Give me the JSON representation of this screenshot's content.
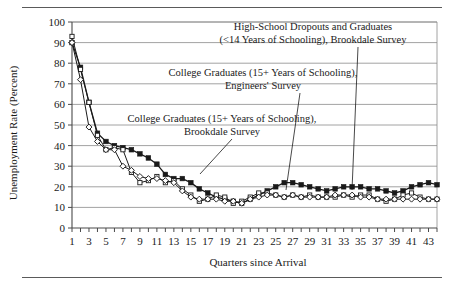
{
  "figure": {
    "name": "unemployment-rate-by-education-chart",
    "top_rule": true,
    "bottom_rule": true
  },
  "chart_data": {
    "type": "line",
    "title": "",
    "xlabel": "Quarters since Arrival",
    "ylabel": "Unemployment Rate (Percent)",
    "xlim": [
      1,
      44
    ],
    "ylim": [
      0,
      100
    ],
    "ytick_step": 10,
    "yticks": [
      0,
      10,
      20,
      30,
      40,
      50,
      60,
      70,
      80,
      90,
      100
    ],
    "xticks": [
      1,
      2,
      3,
      4,
      5,
      6,
      7,
      8,
      9,
      10,
      11,
      12,
      13,
      14,
      15,
      16,
      17,
      18,
      19,
      20,
      21,
      22,
      23,
      24,
      25,
      26,
      27,
      28,
      29,
      30,
      31,
      32,
      33,
      34,
      35,
      36,
      37,
      38,
      39,
      40,
      41,
      42,
      43,
      44
    ],
    "xtick_labels": [
      "1",
      "",
      "3",
      "",
      "5",
      "",
      "7",
      "",
      "9",
      "",
      "11",
      "",
      "13",
      "",
      "15",
      "",
      "17",
      "",
      "19",
      "",
      "21",
      "",
      "23",
      "",
      "25",
      "",
      "27",
      "",
      "29",
      "",
      "31",
      "",
      "33",
      "",
      "35",
      "",
      "37",
      "",
      "39",
      "",
      "41",
      "",
      "43",
      ""
    ],
    "grid": "horizontal",
    "legend": "annotations",
    "series": [
      {
        "name": "High-School Dropouts and Graduates (<14 Years of Schooling), Brookdale Survey",
        "marker": "square-filled",
        "x": [
          1,
          2,
          3,
          4,
          5,
          6,
          7,
          8,
          9,
          10,
          11,
          12,
          13,
          14,
          15,
          16,
          17,
          18,
          19,
          20,
          21,
          22,
          23,
          24,
          25,
          26,
          27,
          28,
          29,
          30,
          31,
          32,
          33,
          34,
          35,
          36,
          37,
          38,
          39,
          40,
          41,
          42,
          43,
          44
        ],
        "values": [
          90,
          78,
          61,
          46,
          42,
          40,
          39,
          38,
          36,
          34,
          31,
          26,
          24,
          24,
          22,
          19,
          17,
          15,
          14,
          13,
          12,
          14,
          16,
          18,
          20,
          22,
          22,
          21,
          20,
          19,
          18,
          19,
          20,
          20,
          20,
          19,
          19,
          18,
          17,
          18,
          20,
          21,
          22,
          21
        ]
      },
      {
        "name": "College Graduates (15+ Years of Schooling), Engineers' Survey",
        "marker": "square-open",
        "x": [
          1,
          2,
          3,
          4,
          5,
          6,
          7,
          8,
          9,
          10,
          11,
          12,
          13,
          14,
          15,
          16,
          17,
          18,
          19,
          20,
          21,
          22,
          23,
          24,
          25,
          26,
          27,
          28,
          29,
          30,
          31,
          32,
          33,
          34,
          35,
          36,
          37,
          38,
          39,
          40,
          41,
          42,
          43,
          44
        ],
        "values": [
          93,
          77,
          61,
          45,
          38,
          39,
          38,
          27,
          22,
          23,
          25,
          22,
          23,
          19,
          16,
          13,
          14,
          16,
          15,
          12,
          13,
          15,
          17,
          17,
          16,
          15,
          16,
          15,
          16,
          15,
          15,
          15,
          16,
          15,
          16,
          16,
          14,
          13,
          14,
          16,
          17,
          15,
          14,
          14
        ]
      },
      {
        "name": "College Graduates (15+ Years of Schooling), Brookdale Survey",
        "marker": "diamond-open",
        "x": [
          1,
          2,
          3,
          4,
          5,
          6,
          7,
          8,
          9,
          10,
          11,
          12,
          13,
          14,
          15,
          16,
          17,
          18,
          19,
          20,
          21,
          22,
          23,
          24,
          25,
          26,
          27,
          28,
          29,
          30,
          31,
          32,
          33,
          34,
          35,
          36,
          37,
          38,
          39,
          40,
          41,
          42,
          43,
          44
        ],
        "values": [
          90,
          72,
          49,
          42,
          38,
          38,
          30,
          28,
          25,
          24,
          24,
          23,
          22,
          18,
          15,
          14,
          14,
          14,
          13,
          13,
          12,
          14,
          15,
          16,
          16,
          15,
          16,
          15,
          15,
          15,
          15,
          16,
          16,
          16,
          15,
          15,
          14,
          14,
          14,
          14,
          14,
          14,
          14,
          14
        ]
      }
    ]
  },
  "annotations": [
    {
      "id": "annot-highschool",
      "line1": "High-School Dropouts and Graduates",
      "line2": "(<14 Years of Schooling), Brookdale Survey",
      "target_label": "high-school-series"
    },
    {
      "id": "annot-engineers",
      "line1": "College Graduates (15+ Years of Schooling),",
      "line2": "Engineers' Survey",
      "target_label": "engineers-series"
    },
    {
      "id": "annot-brookdale-college",
      "line1": "College Graduates (15+ Years of Schooling),",
      "line2": "Brookdale Survey",
      "target_label": "brookdale-college-series"
    }
  ],
  "colors": {
    "ink": "#1a1a1a",
    "grid": "#8a8a8a",
    "axis": "#4a4a4a",
    "rule": "#5a5a5a"
  }
}
